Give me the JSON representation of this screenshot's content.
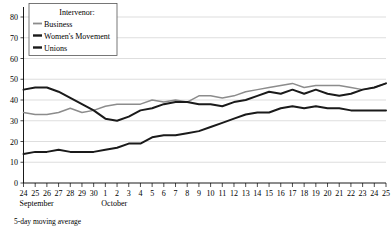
{
  "chart_data": {
    "type": "line",
    "title": "",
    "subtitle": "",
    "xlabel": "",
    "ylabel": "",
    "ylim": [
      0,
      80
    ],
    "ytick_labels": [
      "0",
      "10",
      "20",
      "30",
      "40",
      "50",
      "60",
      "70",
      "80"
    ],
    "yticks": [
      0,
      10,
      20,
      30,
      40,
      50,
      60,
      70,
      80
    ],
    "grid": true,
    "legend_position": "top-left",
    "legend_title": "Intervenor:",
    "footnote": "5-day moving average",
    "x": [
      "24",
      "25",
      "26",
      "27",
      "28",
      "29",
      "30",
      "1",
      "2",
      "3",
      "4",
      "5",
      "6",
      "7",
      "8",
      "9",
      "10",
      "11",
      "12",
      "13",
      "14",
      "15",
      "16",
      "17",
      "18",
      "19",
      "20",
      "21",
      "22",
      "23",
      "24",
      "25"
    ],
    "x_tick_labels": [
      "24",
      "25",
      "26",
      "27",
      "28",
      "29",
      "30",
      "1",
      "2",
      "3",
      "4",
      "5",
      "6",
      "7",
      "8",
      "9",
      "10",
      "11",
      "12",
      "13",
      "14",
      "15",
      "16",
      "17",
      "18",
      "19",
      "20",
      "21",
      "22",
      "23",
      "24",
      "25"
    ],
    "x_group_labels": [
      {
        "label": "September",
        "start_index": 0
      },
      {
        "label": "October",
        "start_index": 7
      }
    ],
    "series": [
      {
        "name": "Business",
        "color": "#8c8c8c",
        "values": [
          34,
          33,
          33,
          34,
          36,
          34,
          35,
          37,
          38,
          38,
          38,
          40,
          39,
          40,
          39,
          42,
          42,
          41,
          42,
          44,
          45,
          46,
          47,
          48,
          46,
          47,
          47,
          47,
          46,
          45,
          46,
          48
        ]
      },
      {
        "name": "Women's Movement",
        "color": "#1a1a1a",
        "values": [
          45,
          46,
          46,
          44,
          41,
          38,
          35,
          31,
          30,
          32,
          35,
          36,
          38,
          39,
          39,
          38,
          38,
          37,
          39,
          40,
          42,
          44,
          43,
          45,
          43,
          45,
          43,
          42,
          43,
          45,
          46,
          48
        ]
      },
      {
        "name": "Unions",
        "color": "#1a1a1a",
        "values": [
          14,
          15,
          15,
          16,
          15,
          15,
          15,
          16,
          17,
          19,
          19,
          22,
          23,
          23,
          24,
          25,
          27,
          29,
          31,
          33,
          34,
          34,
          36,
          37,
          36,
          37,
          36,
          36,
          35,
          35,
          35,
          35
        ]
      }
    ]
  }
}
